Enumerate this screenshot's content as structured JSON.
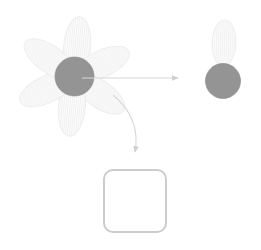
{
  "canvas": {
    "width": 261,
    "height": 250,
    "background_color": "#ffffff",
    "title": "Flower decomposition diagram"
  },
  "colors": {
    "petal_fill": "#fbfbfb",
    "petal_stroke": "#eeeeee",
    "petal_stripe": "#f2f2f2",
    "center_fill": "#949494",
    "center_stroke": "#8d8d8d",
    "arrow_stroke": "#d8d8d8",
    "arrow_head": "#cfcfcf",
    "box_stroke": "#cccccc",
    "box_fill": "#ffffff"
  },
  "flower": {
    "name": "source-flower",
    "center": {
      "cx": 74.5,
      "cy": 76.5,
      "r": 19.5
    },
    "petal": {
      "rx": 13.5,
      "ry": 30,
      "offset": 30
    },
    "petal_count": 6,
    "petal_angles": [
      5,
      65,
      125,
      185,
      245,
      305
    ]
  },
  "extracted": {
    "name": "extracted-part",
    "center": {
      "cx": 223,
      "cy": 81,
      "r": 17.5
    },
    "petal": {
      "cx": 224,
      "cy": 43,
      "rx": 12,
      "ry": 23,
      "angle": 2
    }
  },
  "arrows": [
    {
      "name": "extract-arrow",
      "kind": "straight",
      "from_x": 82,
      "from_y": 78,
      "to_x": 180,
      "to_y": 78,
      "head_size": 7
    },
    {
      "name": "place-arrow",
      "kind": "curved",
      "from_x": 113,
      "from_y": 95,
      "ctrl_x": 141,
      "ctrl_y": 118,
      "to_x": 135,
      "to_y": 158,
      "head_size": 7
    }
  ],
  "drop_target": {
    "name": "empty-drop-square",
    "x": 104,
    "y": 170,
    "width": 62,
    "height": 62,
    "radius": 9,
    "label": ""
  }
}
